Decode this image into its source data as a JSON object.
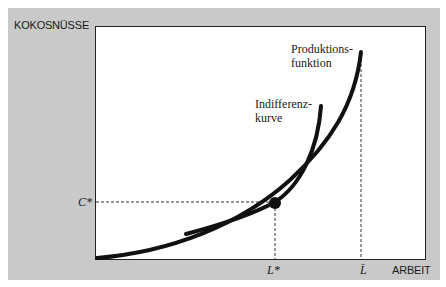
{
  "axes": {
    "y_label": "KOKOSNÜSSE",
    "x_label": "ARBEIT"
  },
  "markers": {
    "c_star": "C*",
    "l_star": "L*",
    "l_bar": "L̄"
  },
  "curves": {
    "production_line1": "Produktions-",
    "production_line2": "funktion",
    "indifference_line1": "Indifferenz-",
    "indifference_line2": "kurve"
  },
  "colors": {
    "panel": "#c9c9c9",
    "plot_bg": "#ffffff",
    "curve": "#111111"
  }
}
